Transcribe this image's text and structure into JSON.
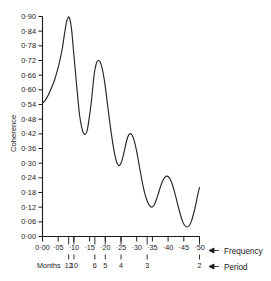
{
  "chart_data": {
    "type": "line",
    "title": "",
    "xlabel": "Frequency",
    "ylabel": "Coherence",
    "secondary_xlabel": "Period",
    "secondary_xlabel_prefix": "Months",
    "xlim": [
      0.0,
      0.5
    ],
    "ylim": [
      0.0,
      0.9
    ],
    "grid": false,
    "legend": "none",
    "x_tick_labels": [
      "0·00",
      "·05",
      "·10",
      "·15",
      "·20",
      "·25",
      "·30",
      "·35",
      "·40",
      "·45",
      "·50"
    ],
    "x_tick_values": [
      0.0,
      0.05,
      0.1,
      0.15,
      0.2,
      0.25,
      0.3,
      0.35,
      0.4,
      0.45,
      0.5
    ],
    "y_tick_labels": [
      "0·90",
      "0·84",
      "0·78",
      "0·72",
      "0·66",
      "0·60",
      "0·54",
      "0·48",
      "0·42",
      "0·36",
      "0·30",
      "0·24",
      "0·18",
      "0·12",
      "0·06",
      "0·00"
    ],
    "y_tick_values": [
      0.9,
      0.84,
      0.78,
      0.72,
      0.66,
      0.6,
      0.54,
      0.48,
      0.42,
      0.36,
      0.3,
      0.24,
      0.18,
      0.12,
      0.06,
      0.0
    ],
    "period_tick_labels": [
      "12",
      "10",
      "6",
      "5",
      "4",
      "3",
      "2"
    ],
    "period_tick_values": [
      0.0833,
      0.1,
      0.1667,
      0.2,
      0.25,
      0.3333,
      0.5
    ],
    "series": [
      {
        "name": "Coherence",
        "color": "#262626",
        "x": [
          0.0,
          0.006,
          0.013,
          0.019,
          0.025,
          0.031,
          0.038,
          0.044,
          0.05,
          0.056,
          0.063,
          0.069,
          0.075,
          0.079,
          0.083,
          0.086,
          0.09,
          0.094,
          0.098,
          0.103,
          0.108,
          0.113,
          0.118,
          0.124,
          0.13,
          0.136,
          0.142,
          0.148,
          0.155,
          0.161,
          0.166,
          0.172,
          0.178,
          0.184,
          0.19,
          0.197,
          0.204,
          0.211,
          0.218,
          0.225,
          0.231,
          0.237,
          0.243,
          0.25,
          0.257,
          0.264,
          0.271,
          0.278,
          0.285,
          0.292,
          0.299,
          0.306,
          0.313,
          0.32,
          0.327,
          0.334,
          0.341,
          0.348,
          0.355,
          0.362,
          0.369,
          0.376,
          0.383,
          0.39,
          0.397,
          0.404,
          0.411,
          0.418,
          0.425,
          0.432,
          0.439,
          0.446,
          0.453,
          0.46,
          0.467,
          0.474,
          0.481,
          0.488,
          0.494,
          0.5
        ],
        "y": [
          0.545,
          0.553,
          0.566,
          0.58,
          0.597,
          0.616,
          0.638,
          0.664,
          0.692,
          0.725,
          0.768,
          0.82,
          0.868,
          0.888,
          0.898,
          0.893,
          0.872,
          0.83,
          0.77,
          0.7,
          0.628,
          0.56,
          0.497,
          0.452,
          0.424,
          0.418,
          0.432,
          0.478,
          0.545,
          0.62,
          0.676,
          0.71,
          0.72,
          0.714,
          0.688,
          0.64,
          0.572,
          0.5,
          0.432,
          0.372,
          0.33,
          0.302,
          0.29,
          0.3,
          0.33,
          0.37,
          0.405,
          0.42,
          0.415,
          0.392,
          0.354,
          0.305,
          0.255,
          0.208,
          0.17,
          0.143,
          0.126,
          0.12,
          0.128,
          0.148,
          0.176,
          0.205,
          0.228,
          0.243,
          0.247,
          0.24,
          0.222,
          0.194,
          0.16,
          0.124,
          0.09,
          0.062,
          0.045,
          0.039,
          0.044,
          0.062,
          0.092,
          0.13,
          0.168,
          0.2
        ]
      }
    ],
    "series_tail": {
      "x": [
        0.5,
        0.51,
        0.52,
        0.53,
        0.54,
        0.55,
        0.56
      ],
      "y": [
        0.2,
        0.24,
        0.285,
        0.32,
        0.334,
        0.322,
        0.3
      ]
    },
    "annotations": [
      {
        "label": "peak-1",
        "x": 0.083,
        "y": 0.9
      },
      {
        "label": "trough-1",
        "x": 0.135,
        "y": 0.42
      },
      {
        "label": "peak-2",
        "x": 0.178,
        "y": 0.72
      },
      {
        "label": "trough-2",
        "x": 0.243,
        "y": 0.29
      },
      {
        "label": "peak-3",
        "x": 0.278,
        "y": 0.42
      },
      {
        "label": "trough-3",
        "x": 0.348,
        "y": 0.12
      },
      {
        "label": "peak-4",
        "x": 0.397,
        "y": 0.247
      },
      {
        "label": "trough-4",
        "x": 0.46,
        "y": 0.039
      }
    ]
  },
  "axis": {
    "y_title": "Coherence",
    "frequency_label": "Frequency",
    "period_label": "Period",
    "months_label": "Months",
    "arrow_glyph": "←"
  }
}
